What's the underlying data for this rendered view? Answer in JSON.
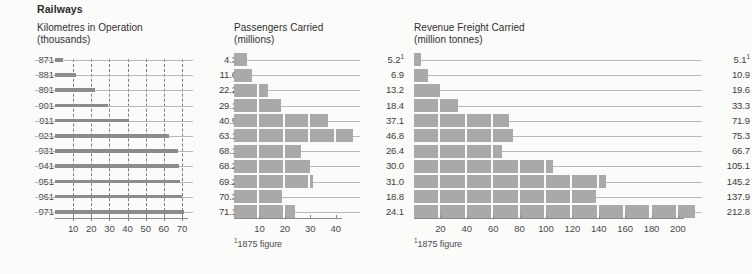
{
  "section": {
    "title": "Railways"
  },
  "footnote": {
    "text": "1875 figure",
    "marker": "1"
  },
  "years": [
    "1871",
    "1881",
    "1891",
    "1901",
    "1911",
    "1921",
    "1931",
    "1941",
    "1951",
    "1961",
    "1971"
  ],
  "year_labels_clipped": [
    "871",
    "881",
    "891",
    "901",
    "911",
    "921",
    "931",
    "941",
    "951",
    "961",
    "971"
  ],
  "colors": {
    "bar_fill": "#a9a9a9",
    "line_bar": "#8c8c8c",
    "leader": "#b9b9b9",
    "grid": "#7d7d7d",
    "axis": "#8a8a8a",
    "text": "#3a3a3a",
    "page_bg": "#fbfbfa"
  },
  "chart_data": [
    {
      "type": "bar",
      "title": "Kilometres in Operation\n(thousands)",
      "xlabel": "",
      "ylabel": "",
      "unit": "thousands",
      "categories": [
        "1871",
        "1881",
        "1891",
        "1901",
        "1911",
        "1921",
        "1931",
        "1941",
        "1951",
        "1961",
        "1971"
      ],
      "values": [
        4.3,
        11.6,
        22.2,
        29.1,
        40.9,
        63.1,
        68.1,
        68.2,
        69.2,
        70.3,
        71.1
      ],
      "value_labels": [
        "4.3",
        "11.6",
        "22.2",
        "29.1",
        "40.9",
        "63.1",
        "68.1",
        "68.2",
        "69.2",
        "70.3",
        "71.1"
      ],
      "ticks": [
        10,
        20,
        30,
        40,
        50,
        60,
        70
      ],
      "tick_labels": [
        "10",
        "20",
        "30",
        "40",
        "50",
        "60",
        "70"
      ],
      "xlim": [
        0,
        75
      ],
      "grid": true,
      "style": "line-bar"
    },
    {
      "type": "bar",
      "title": "Passengers Carried\n(millions)",
      "xlabel": "",
      "ylabel": "",
      "unit": "millions",
      "categories": [
        "1871",
        "1881",
        "1891",
        "1901",
        "1911",
        "1921",
        "1931",
        "1941",
        "1951",
        "1961",
        "1971"
      ],
      "values": [
        5.2,
        6.9,
        13.2,
        18.4,
        37.1,
        46.8,
        26.4,
        30.0,
        31.0,
        18.8,
        24.1
      ],
      "value_labels": [
        "5.2",
        "6.9",
        "13.2",
        "18.4",
        "37.1",
        "46.8",
        "26.4",
        "30.0",
        "31.0",
        "18.8",
        "24.1"
      ],
      "value_superscripts": [
        "1",
        "",
        "",
        "",
        "",
        "",
        "",
        "",
        "",
        "",
        ""
      ],
      "ticks": [
        10,
        20,
        30,
        40
      ],
      "tick_labels": [
        "10",
        "20",
        "30",
        "40"
      ],
      "xlim": [
        0,
        48
      ],
      "segment_step": 10,
      "grid": false,
      "style": "segmented-block"
    },
    {
      "type": "bar",
      "title": "Revenue Freight Carried\n(million tonnes)",
      "xlabel": "",
      "ylabel": "",
      "unit": "million tonnes",
      "categories": [
        "1871",
        "1881",
        "1891",
        "1901",
        "1911",
        "1921",
        "1931",
        "1941",
        "1951",
        "1961",
        "1971"
      ],
      "values": [
        5.1,
        10.9,
        19.6,
        33.3,
        71.9,
        75.3,
        66.7,
        105.1,
        145.2,
        137.9,
        212.8
      ],
      "value_labels": [
        "5.1",
        "10.9",
        "19.6",
        "33.3",
        "71.9",
        "75.3",
        "66.7",
        "105.1",
        "145.2",
        "137.9",
        "212.8"
      ],
      "value_superscripts": [
        "1",
        "",
        "",
        "",
        "",
        "",
        "",
        "",
        "",
        "",
        ""
      ],
      "ticks": [
        20,
        40,
        60,
        80,
        100,
        120,
        140,
        160,
        180,
        200
      ],
      "tick_labels": [
        "20",
        "40",
        "60",
        "80",
        "100",
        "120",
        "140",
        "160",
        "180",
        "200"
      ],
      "xlim": [
        0,
        216
      ],
      "segment_step": 20,
      "grid": false,
      "style": "segmented-block"
    }
  ]
}
